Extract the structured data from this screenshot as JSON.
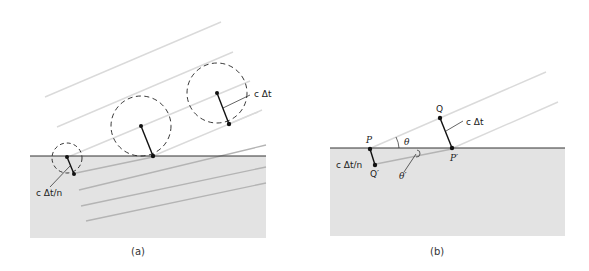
{
  "figure": {
    "panels": [
      {
        "id": "a",
        "caption": "(a)",
        "labels": {
          "wavelet_radius_air": "c Δt",
          "wavelet_radius_medium": "c Δt/n"
        }
      },
      {
        "id": "b",
        "caption": "(b)",
        "labels": {
          "point_p": "P",
          "point_q": "Q",
          "point_p_prime": "P′",
          "point_q_prime": "Q′",
          "angle_incident": "θ",
          "angle_refracted": "θ′",
          "segment_air": "c Δt",
          "segment_medium": "c Δt/n"
        }
      }
    ],
    "colors": {
      "medium_fill": "#e3e3e3",
      "incident_ray": "#d9d9d9",
      "refracted_ray": "#b4b4b4",
      "surface_line": "#333333",
      "ink": "#111111"
    }
  }
}
